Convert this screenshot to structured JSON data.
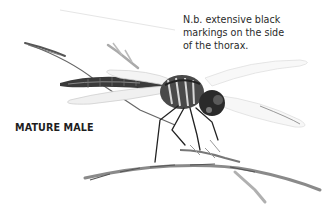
{
  "annotation": {
    "note_text": "N.b. extensive black\nmarkings on the side\nof the thorax.",
    "label": "MATURE MALE"
  },
  "illustration": {
    "subject": "dragonfly perched on grass stem",
    "style": "pencil sketch",
    "colors": {
      "background": "#ffffff",
      "ink_dark": "#1a1a1a",
      "ink_mid": "#6a6a6a",
      "ink_light": "#bdbdbd"
    }
  }
}
